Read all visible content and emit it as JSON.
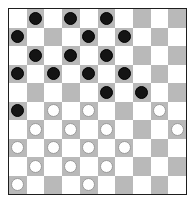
{
  "game": "draughts",
  "board": {
    "size": 10,
    "colors": {
      "light": "#ffffff",
      "dark": "#b9b9b9",
      "border": "#1e1e1e"
    },
    "rows": [
      [
        null,
        "b",
        null,
        "b",
        null,
        "b",
        null,
        null,
        null,
        null
      ],
      [
        "b",
        null,
        null,
        null,
        "b",
        null,
        "b",
        null,
        null,
        null
      ],
      [
        null,
        "b",
        null,
        "b",
        null,
        "b",
        null,
        null,
        null,
        null
      ],
      [
        "b",
        null,
        "b",
        null,
        "b",
        null,
        "b",
        null,
        null,
        null
      ],
      [
        null,
        null,
        null,
        null,
        null,
        "b",
        null,
        "b",
        null,
        null
      ],
      [
        "b",
        null,
        "w",
        null,
        "w",
        null,
        null,
        null,
        "w",
        null
      ],
      [
        null,
        "w",
        null,
        "w",
        null,
        "w",
        null,
        null,
        null,
        "w"
      ],
      [
        "w",
        null,
        "w",
        null,
        "w",
        null,
        "w",
        null,
        null,
        null
      ],
      [
        null,
        "w",
        null,
        "w",
        null,
        "w",
        null,
        null,
        null,
        null
      ],
      [
        "w",
        null,
        null,
        null,
        "w",
        null,
        null,
        null,
        null,
        null
      ]
    ]
  },
  "pieces": {
    "b": {
      "name": "black-piece",
      "color": "#141414"
    },
    "w": {
      "name": "white-piece",
      "color": "#ffffff"
    }
  }
}
